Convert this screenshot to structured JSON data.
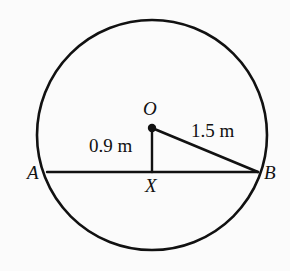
{
  "figure": {
    "type": "circle-chord-geometry-diagram",
    "background_color": "#fbfbfb",
    "stroke_color": "#111111",
    "circle": {
      "center_x": 152,
      "center_y": 135,
      "radius": 115,
      "stroke_width": 2.6
    },
    "center_dot": {
      "x": 152,
      "y": 128,
      "radius": 4.2
    },
    "chord_ab": {
      "x1": 47,
      "y1": 172,
      "x2": 258,
      "y2": 172,
      "stroke_width": 2.4
    },
    "segment_ox": {
      "x1": 152,
      "y1": 128,
      "x2": 152,
      "y2": 172,
      "stroke_width": 2.4
    },
    "segment_ob": {
      "x1": 152,
      "y1": 128,
      "x2": 258,
      "y2": 172,
      "stroke_width": 2.6
    }
  },
  "labels": {
    "point_o": "O",
    "point_a": "A",
    "point_b": "B",
    "point_x": "X",
    "distance_ox": "0.9 m",
    "distance_ob": "1.5 m"
  },
  "label_positions": {
    "point_o": {
      "left": 143,
      "top": 99
    },
    "point_a": {
      "left": 27,
      "top": 163
    },
    "point_b": {
      "left": 264,
      "top": 163
    },
    "point_x": {
      "left": 145,
      "top": 176
    },
    "distance_ox": {
      "left": 89,
      "top": 136
    },
    "distance_ob": {
      "left": 191,
      "top": 121
    }
  }
}
